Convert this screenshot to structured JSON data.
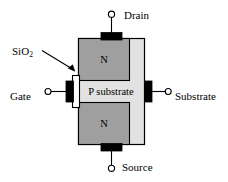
{
  "figure": {
    "kind": "mosfet-cross-section-diagram",
    "background_color": "#ffffff",
    "line_color": "#000000",
    "terminals": {
      "drain_label": "Drain",
      "source_label": "Source",
      "gate_label": "Gate",
      "substrate_label": "Substrate"
    },
    "annotations": {
      "oxide_label": "SiO",
      "oxide_label_subscript": "2"
    },
    "regions": {
      "n_region_top_label": "N",
      "n_region_bottom_label": "N",
      "body_label": "P substrate"
    },
    "colors": {
      "body_fill": "#e2e2e2",
      "n_region_fill": "#9f9f9f",
      "contact_fill": "#000000",
      "oxide_fill": "#ffffff",
      "outline": "#000000"
    }
  }
}
